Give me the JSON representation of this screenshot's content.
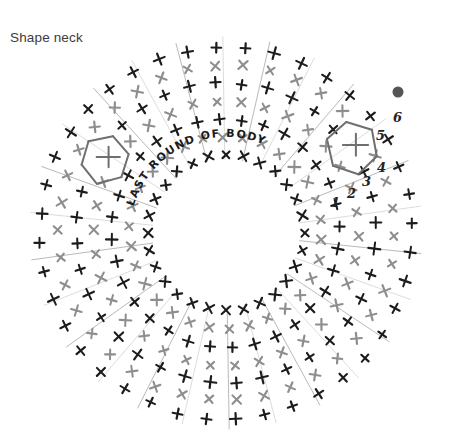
{
  "page": {
    "title": "Shape neck",
    "background": "#ffffff"
  },
  "diagram": {
    "name": "crochet-neck-shaping-chart",
    "type": "crochet-stitch-chart",
    "center": {
      "x": 226,
      "y": 233
    },
    "inner_radius": 63,
    "outer_radius": 205,
    "curved_label": "LAST ROUND OF BODY",
    "curved_label_radius": 96,
    "curved_label_start_angle": 196,
    "stitch_numbers": [
      "1",
      "2",
      "3",
      "4",
      "5",
      "6"
    ],
    "start_dot": {
      "x": 398,
      "y": 92,
      "r": 5.5,
      "color": "#555555"
    },
    "colors": {
      "round_dark": "#1c1c1c",
      "round_light": "#8e8e8e",
      "chain_loop": "#6f6f6f",
      "title_text": "#3b3b3b",
      "hand_text": "#1b1b1b",
      "number_text": "#232323"
    },
    "rounds": [
      {
        "index": 0,
        "radius": 78,
        "color": "round_dark",
        "stitch": "x",
        "count": 28
      },
      {
        "index": 1,
        "radius": 96,
        "color": "round_light",
        "stitch": "x",
        "count": 30
      },
      {
        "index": 2,
        "radius": 114,
        "color": "round_dark",
        "stitch": "+",
        "count": 32
      },
      {
        "index": 3,
        "radius": 132,
        "color": "round_light",
        "stitch": "x",
        "count": 34
      },
      {
        "index": 4,
        "radius": 150,
        "color": "round_dark",
        "stitch": "+",
        "count": 36
      },
      {
        "index": 5,
        "radius": 168,
        "color": "round_light",
        "stitch": "x",
        "count": 38
      },
      {
        "index": 6,
        "radius": 186,
        "color": "round_dark",
        "stitch": "+",
        "count": 40
      }
    ],
    "chain_loops": [
      {
        "side": "left",
        "cx": 105,
        "cy": 160,
        "r": 24
      },
      {
        "side": "right",
        "cx": 352,
        "cy": 148,
        "r": 26
      }
    ]
  }
}
